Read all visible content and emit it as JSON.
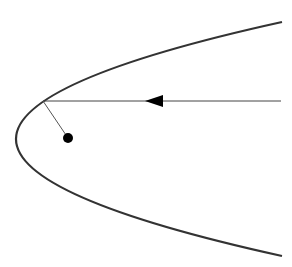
{
  "diagram": {
    "type": "parabolic-reflector",
    "background": "#ffffff",
    "stroke_color": "#333333",
    "parabola": {
      "start": [
        282,
        22
      ],
      "control": [
        -250,
        139
      ],
      "end": [
        282,
        256
      ],
      "vertex": [
        16,
        138
      ],
      "stroke_width": 2.2
    },
    "incoming_ray": {
      "from": [
        281,
        101
      ],
      "to": [
        43,
        101
      ],
      "stroke_width": 1,
      "arrow": {
        "tip": [
          145,
          101
        ],
        "back_x": 163,
        "half_height": 6
      }
    },
    "reflected_ray": {
      "from": [
        43,
        101
      ],
      "to": [
        68,
        138
      ],
      "stroke_width": 1
    },
    "focus_point": {
      "center": [
        68,
        138
      ],
      "radius": 5,
      "fill": "#000000"
    }
  }
}
